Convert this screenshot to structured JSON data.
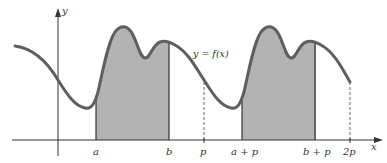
{
  "figure": {
    "curve_label": "y = f(x)",
    "axes": {
      "x_label": "x",
      "y_label": "y"
    },
    "x_ticks": [
      {
        "id": "a",
        "label": "a",
        "shaded_boundary": true
      },
      {
        "id": "b",
        "label": "b",
        "shaded_boundary": true
      },
      {
        "id": "p",
        "label": "p",
        "dashed": true
      },
      {
        "id": "a_plus_p",
        "label": "a + p",
        "shaded_boundary": true
      },
      {
        "id": "b_plus_p",
        "label": "b + p",
        "shaded_boundary": true
      },
      {
        "id": "2p",
        "label": "2p",
        "dashed": true
      }
    ],
    "shaded_regions": [
      {
        "from": "a",
        "to": "b"
      },
      {
        "from": "a + p",
        "to": "b + p"
      }
    ],
    "colors": {
      "curve": "#5f5f5f",
      "shade": "#b3b3b3",
      "axis": "#333333"
    }
  }
}
